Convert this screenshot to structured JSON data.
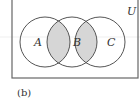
{
  "diagram": {
    "type": "venn",
    "universe_label": "U",
    "sets": [
      {
        "label": "A",
        "cx": 45,
        "cy": 42,
        "r": 25
      },
      {
        "label": "B",
        "cx": 72,
        "cy": 42,
        "r": 25
      },
      {
        "label": "C",
        "cx": 100,
        "cy": 42,
        "r": 25
      }
    ],
    "shaded_regions": [
      "A ∩ B",
      "B ∩ C"
    ],
    "shade_color": "#d6d6d6",
    "line_color": "#555555",
    "caption": "(b)"
  }
}
